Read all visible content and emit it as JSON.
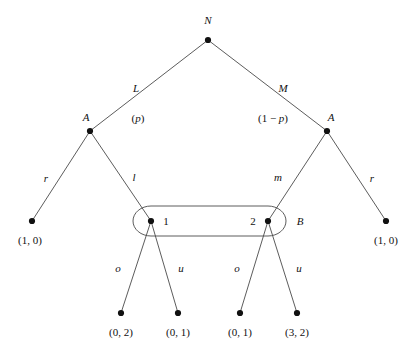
{
  "figure": {
    "kind": "extensive-form-game-tree",
    "background_color": "#ffffff",
    "line_color": "#4a4a4a",
    "node_color": "#111111",
    "text_color": "#111111",
    "width": 414,
    "height": 354
  },
  "nodes": [
    {
      "id": "root",
      "label": "N",
      "label_position": "above",
      "x": 208,
      "y": 40,
      "lx": 208,
      "ly": 20
    },
    {
      "id": "a-left",
      "label": "A",
      "label_position": "upper-left",
      "x": 90,
      "y": 131,
      "lx": 86,
      "ly": 117
    },
    {
      "id": "a-right",
      "label": "A",
      "label_position": "upper-right",
      "x": 327,
      "y": 131,
      "lx": 331,
      "ly": 117
    },
    {
      "id": "b-one",
      "label": "1",
      "label_position": "right",
      "x": 151,
      "y": 221,
      "lx": 166,
      "ly": 221
    },
    {
      "id": "b-two",
      "label": "2",
      "label_position": "left",
      "x": 268,
      "y": 221,
      "lx": 253,
      "ly": 221
    }
  ],
  "terminals": [
    {
      "id": "t-far-left",
      "x": 32,
      "y": 221,
      "payoff": "(1, 0)",
      "px": 30,
      "py": 240
    },
    {
      "id": "t-far-right",
      "x": 386,
      "y": 221,
      "payoff": "(1, 0)",
      "px": 386,
      "py": 240
    },
    {
      "id": "t-1-o",
      "x": 121,
      "y": 313,
      "payoff": "(0, 2)",
      "px": 121,
      "py": 332
    },
    {
      "id": "t-1-u",
      "x": 178,
      "y": 313,
      "payoff": "(0, 1)",
      "px": 178,
      "py": 332
    },
    {
      "id": "t-2-o",
      "x": 240,
      "y": 313,
      "payoff": "(0, 1)",
      "px": 240,
      "py": 332
    },
    {
      "id": "t-2-u",
      "x": 297,
      "y": 313,
      "payoff": "(3, 2)",
      "px": 297,
      "py": 332
    }
  ],
  "edges": [
    {
      "id": "root-to-a-left",
      "from": "root",
      "to": "a-left",
      "x1": 208,
      "y1": 40,
      "x2": 90,
      "y2": 131
    },
    {
      "id": "root-to-a-right",
      "from": "root",
      "to": "a-right",
      "x1": 208,
      "y1": 40,
      "x2": 327,
      "y2": 131
    },
    {
      "id": "a-left-to-r",
      "from": "a-left",
      "to": "t-far-left",
      "x1": 90,
      "y1": 131,
      "x2": 32,
      "y2": 221
    },
    {
      "id": "a-left-to-l",
      "from": "a-left",
      "to": "b-one",
      "x1": 90,
      "y1": 131,
      "x2": 151,
      "y2": 221
    },
    {
      "id": "a-right-to-m",
      "from": "a-right",
      "to": "b-two",
      "x1": 327,
      "y1": 131,
      "x2": 268,
      "y2": 221
    },
    {
      "id": "a-right-to-r",
      "from": "a-right",
      "to": "t-far-right",
      "x1": 327,
      "y1": 131,
      "x2": 386,
      "y2": 221
    },
    {
      "id": "b-one-to-o",
      "from": "b-one",
      "to": "t-1-o",
      "x1": 151,
      "y1": 221,
      "x2": 121,
      "y2": 313
    },
    {
      "id": "b-one-to-u",
      "from": "b-one",
      "to": "t-1-u",
      "x1": 151,
      "y1": 221,
      "x2": 178,
      "y2": 313
    },
    {
      "id": "b-two-to-o",
      "from": "b-two",
      "to": "t-2-o",
      "x1": 268,
      "y1": 221,
      "x2": 240,
      "y2": 313
    },
    {
      "id": "b-two-to-u",
      "from": "b-two",
      "to": "t-2-u",
      "x1": 268,
      "y1": 221,
      "x2": 297,
      "y2": 313
    }
  ],
  "edge_labels": [
    {
      "id": "label-L",
      "text": "L",
      "x": 136,
      "y": 88,
      "style": "italic"
    },
    {
      "id": "label-M",
      "text": "M",
      "x": 283,
      "y": 88,
      "style": "italic"
    },
    {
      "id": "label-r-left",
      "text": "r",
      "x": 46,
      "y": 178,
      "style": "italic"
    },
    {
      "id": "label-l",
      "text": "l",
      "x": 134,
      "y": 177,
      "style": "italic"
    },
    {
      "id": "label-m",
      "text": "m",
      "x": 278,
      "y": 177,
      "style": "italic"
    },
    {
      "id": "label-r-right",
      "text": "r",
      "x": 372,
      "y": 178,
      "style": "italic"
    },
    {
      "id": "label-o-left",
      "text": "o",
      "x": 118,
      "y": 268,
      "style": "italic"
    },
    {
      "id": "label-u-left",
      "text": "u",
      "x": 181,
      "y": 268,
      "style": "italic"
    },
    {
      "id": "label-o-right",
      "text": "o",
      "x": 237,
      "y": 268,
      "style": "italic"
    },
    {
      "id": "label-u-right",
      "text": "u",
      "x": 299,
      "y": 268,
      "style": "italic"
    }
  ],
  "probabilities": [
    {
      "id": "prob-p",
      "text": "(p)",
      "left_part": "(",
      "var": "p",
      "right_part": ")",
      "x": 138,
      "y": 118
    },
    {
      "id": "prob-1-p",
      "text": "(1 − p)",
      "left_part": "(1 − ",
      "var": "p",
      "right_part": ")",
      "x": 273,
      "y": 118
    }
  ],
  "information_set": {
    "id": "info-set-B",
    "label": "B",
    "label_x": 300,
    "label_y": 221,
    "left_center_x": 151,
    "right_center_x": 268,
    "center_y": 221,
    "radius_y": 15,
    "radius_x": 18
  },
  "players": {
    "nature": "N",
    "player_a": "A",
    "player_b": "B"
  }
}
